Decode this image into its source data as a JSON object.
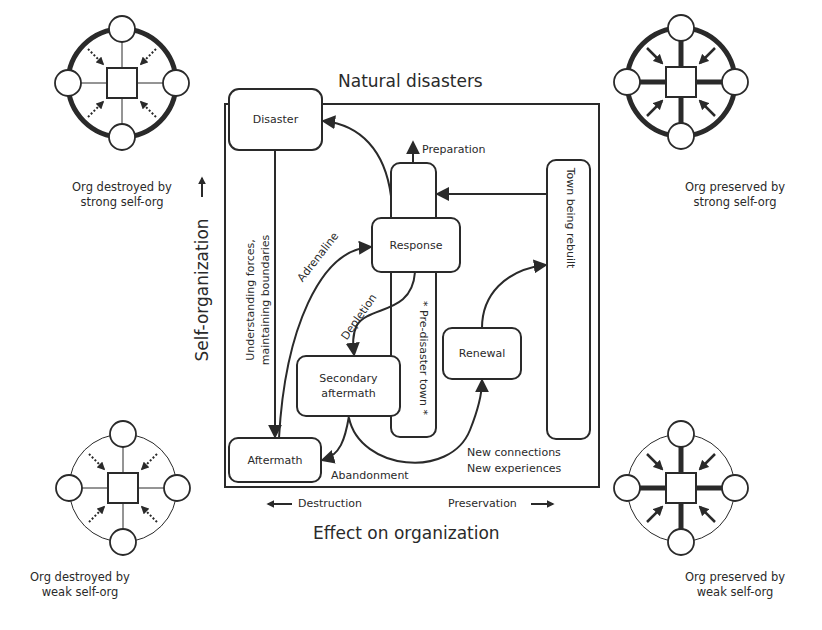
{
  "diagram": {
    "title_top": "Natural disasters",
    "title_bottom": "Effect on organization",
    "y_axis_label": "Self-organization",
    "x_axis": {
      "left_label": "Destruction",
      "right_label": "Preservation"
    },
    "nodes": {
      "disaster": "Disaster",
      "response": "Response",
      "secondary_aftermath_line1": "Secondary",
      "secondary_aftermath_line2": "aftermath",
      "aftermath": "Aftermath",
      "renewal": "Renewal",
      "pre_disaster_town": "* Pre-disaster town *",
      "town_being_rebuilt": "Town being rebuilt"
    },
    "edge_labels": {
      "preparation": "Preparation",
      "adrenaline": "Adrenaline",
      "depletion": "Depletion",
      "understanding_line1": "Understanding forces,",
      "understanding_line2": "maintaining boundaries",
      "abandonment": "Abandonment",
      "new_connections": "New connections",
      "new_experiences": "New experiences"
    },
    "corner_glyphs": {
      "top_left": {
        "line1": "Org destroyed by",
        "line2": "strong self-org"
      },
      "top_right": {
        "line1": "Org preserved by",
        "line2": "strong self-org"
      },
      "bottom_left": {
        "line1": "Org destroyed by",
        "line2": "weak self-org"
      },
      "bottom_right": {
        "line1": "Org preserved by",
        "line2": "weak self-org"
      }
    },
    "colors": {
      "stroke": "#2a2a2a",
      "background": "#ffffff"
    }
  }
}
